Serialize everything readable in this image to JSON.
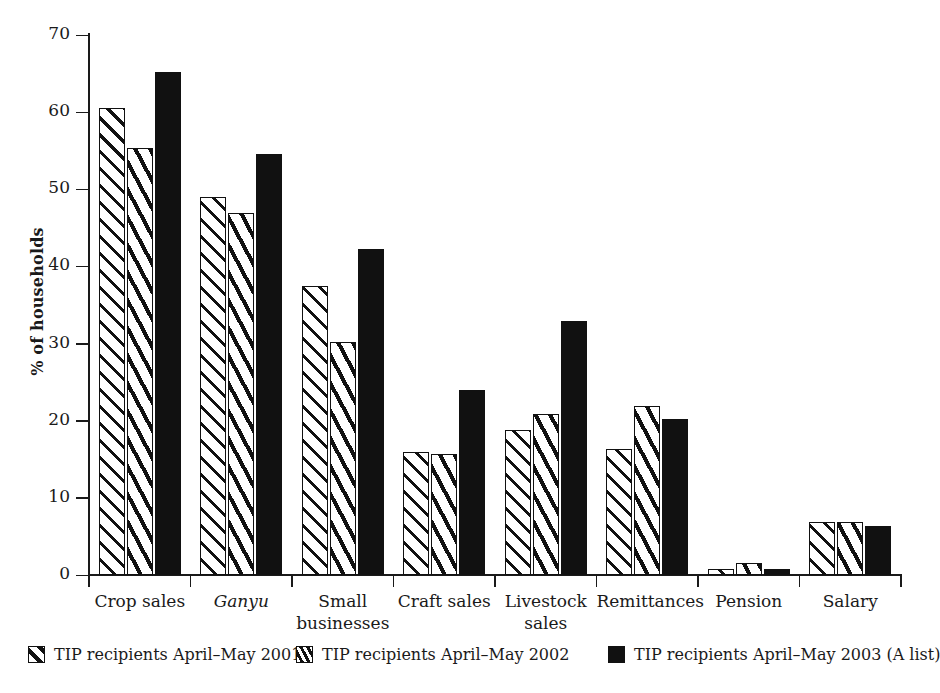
{
  "chart_data": {
    "type": "bar",
    "title": "",
    "xlabel": "",
    "ylabel": "% of households",
    "ylim": [
      0,
      70
    ],
    "yticks": [
      0,
      10,
      20,
      30,
      40,
      50,
      60,
      70
    ],
    "grid": false,
    "legend_position": "bottom",
    "categories": [
      "Crop sales",
      "Ganyu",
      "Small businesses",
      "Craft sales",
      "Livestock sales",
      "Remittances",
      "Pension",
      "Salary"
    ],
    "category_labels": [
      {
        "line1": "Crop sales",
        "line2": "",
        "italic": false
      },
      {
        "line1": "Ganyu",
        "line2": "",
        "italic": true
      },
      {
        "line1": "Small",
        "line2": "businesses",
        "italic": false
      },
      {
        "line1": "Craft sales",
        "line2": "",
        "italic": false
      },
      {
        "line1": "Livestock",
        "line2": "sales",
        "italic": false
      },
      {
        "line1": "Remittances",
        "line2": "",
        "italic": false
      },
      {
        "line1": "Pension",
        "line2": "",
        "italic": false
      },
      {
        "line1": "Salary",
        "line2": "",
        "italic": false
      }
    ],
    "series": [
      {
        "name": "TIP recipients April–May 2001",
        "pattern": "diagonal-hatch-wide",
        "values": [
          60.5,
          49.0,
          37.4,
          16.0,
          18.8,
          16.3,
          0.8,
          6.9
        ]
      },
      {
        "name": "TIP recipients April–May 2002",
        "pattern": "diagonal-hatch-dense",
        "values": [
          55.3,
          46.9,
          30.2,
          15.7,
          20.9,
          21.9,
          1.5,
          6.9
        ]
      },
      {
        "name": "TIP recipients April–May 2003 (A list)",
        "pattern": "solid-black",
        "values": [
          65.2,
          54.6,
          42.3,
          24.0,
          32.9,
          20.2,
          0.8,
          6.4
        ]
      }
    ]
  },
  "legend": {
    "items": [
      {
        "label": "TIP recipients April–May 2001",
        "swatch": "diagonal-hatch-wide"
      },
      {
        "label": "TIP recipients April–May 2002",
        "swatch": "diagonal-hatch-dense"
      },
      {
        "label": "TIP recipients April–May 2003 (A list)",
        "swatch": "solid-black"
      }
    ]
  },
  "colors": {
    "ink": "#111111",
    "background": "#ffffff"
  }
}
